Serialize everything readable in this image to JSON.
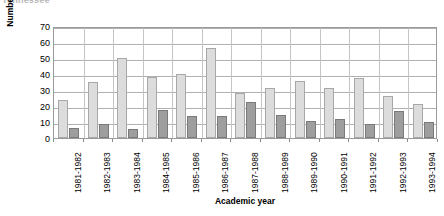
{
  "top_caption": "Tennessee",
  "axis_title_x": "Academic year",
  "axis_title_y": "Number of students/graduates",
  "colors": {
    "series_students": "#dcdcdc",
    "series_graduates": "#9e9e9e",
    "plot_border": "#9a9a9a",
    "gridline": "#b0b0b0",
    "background": "#ffffff"
  },
  "y_ticks": [
    "70",
    "60",
    "50",
    "40",
    "30",
    "20",
    "10",
    "0"
  ],
  "chart_data": {
    "type": "bar",
    "title": "",
    "subtitle": "",
    "xlabel": "Academic year",
    "ylabel": "Number of students/graduates",
    "ylim": [
      0,
      70
    ],
    "ytick_step": 10,
    "yticks": [
      0,
      10,
      20,
      30,
      40,
      50,
      60,
      70
    ],
    "grid": true,
    "legend": false,
    "legend_position": "none",
    "categories": [
      "1981-1982",
      "1982-1983",
      "1983-1984",
      "1984-1985",
      "1985-1986",
      "1986-1987",
      "1987-1988",
      "1988-1989",
      "1989-1990",
      "1990-1991",
      "1991-1992",
      "1992-1993",
      "1993-1994"
    ],
    "series": [
      {
        "name": "Students",
        "color": "#dcdcdc",
        "values": [
          24,
          35,
          50,
          38,
          40,
          56,
          28,
          31,
          35.5,
          31.5,
          37.5,
          26,
          21
        ]
      },
      {
        "name": "Graduates",
        "color": "#9e9e9e",
        "values": [
          6.5,
          8.5,
          5.5,
          17.5,
          13.5,
          13.5,
          22.5,
          14.5,
          10.5,
          12,
          9,
          17,
          10
        ]
      }
    ]
  }
}
